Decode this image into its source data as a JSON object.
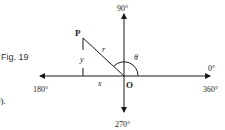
{
  "figure": {
    "caption": "Fig. 19",
    "fragment_text": "9).",
    "labels": {
      "top": "90°",
      "bottom": "270°",
      "left": "180°",
      "right_top": "0°",
      "right_bottom": "360°",
      "point": "P",
      "origin": "O",
      "radius": "r",
      "angle": "θ",
      "x": "x",
      "y": "y"
    },
    "colors": {
      "line": "#1a1a1a",
      "background": "#ffffff"
    }
  }
}
